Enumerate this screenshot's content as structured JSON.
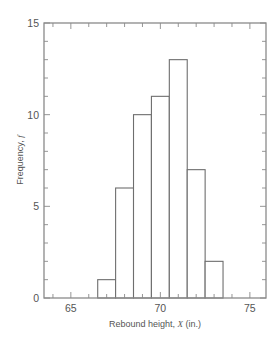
{
  "chart_data": {
    "type": "bar",
    "subtype": "histogram",
    "title": "",
    "xlabel": "Rebound height, X (in.)",
    "xlabel_parts": {
      "prefix": "Rebound height, ",
      "var": "X",
      "suffix": " (in.)"
    },
    "ylabel": "Frequency, f",
    "ylabel_parts": {
      "prefix": "Frequency, ",
      "var": "f"
    },
    "xlim": [
      63.5,
      75.9
    ],
    "ylim": [
      0,
      15
    ],
    "x_ticks": [
      65,
      70,
      75
    ],
    "y_ticks": [
      0,
      5,
      10,
      15
    ],
    "x_minor_step": 1,
    "y_minor_step": 1,
    "grid": false,
    "legend": null,
    "bins": [
      {
        "from": 66.5,
        "to": 67.5,
        "center": 67,
        "count": 1
      },
      {
        "from": 67.5,
        "to": 68.5,
        "center": 68,
        "count": 6
      },
      {
        "from": 68.5,
        "to": 69.5,
        "center": 69,
        "count": 10
      },
      {
        "from": 69.5,
        "to": 70.5,
        "center": 70,
        "count": 11
      },
      {
        "from": 70.5,
        "to": 71.5,
        "center": 71,
        "count": 13
      },
      {
        "from": 71.5,
        "to": 72.5,
        "center": 72,
        "count": 7
      },
      {
        "from": 72.5,
        "to": 73.5,
        "center": 73,
        "count": 2
      }
    ],
    "categories": [
      "67",
      "68",
      "69",
      "70",
      "71",
      "72",
      "73"
    ],
    "values": [
      1,
      6,
      10,
      11,
      13,
      7,
      2
    ]
  },
  "style": {
    "frame_color": "#8a8a8a",
    "bar_edge_color": "#6e6e6e",
    "bar_fill": "#ffffff",
    "text_color": "#555555"
  }
}
